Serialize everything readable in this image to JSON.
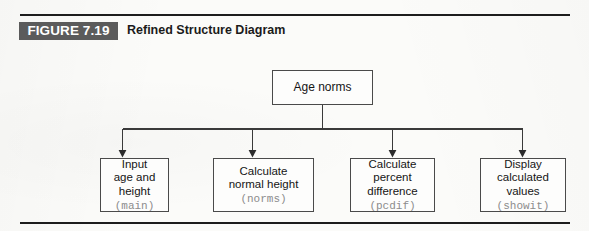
{
  "figure": {
    "badge_label": "FIGURE 7.19",
    "caption": "Refined Structure Diagram",
    "badge_color": "#5b5b5b",
    "rule_color": "#1d1d1d"
  },
  "diagram": {
    "type": "structure-chart",
    "root": {
      "id": "root",
      "lines": [
        "Age norms"
      ],
      "code": null
    },
    "children": [
      {
        "id": "input",
        "lines": [
          "Input",
          "age and",
          "height"
        ],
        "code": "(main)"
      },
      {
        "id": "norms",
        "lines": [
          "Calculate",
          "normal height"
        ],
        "code": "(norms)"
      },
      {
        "id": "pcdif",
        "lines": [
          "Calculate",
          "percent",
          "difference"
        ],
        "code": "(pcdif)"
      },
      {
        "id": "showit",
        "lines": [
          "Display",
          "calculated",
          "values"
        ],
        "code": "(showit)"
      }
    ],
    "connector_color": "#3a3a3a",
    "box_border_color": "#4a4a4a",
    "code_text_color": "#8c8c8c"
  }
}
